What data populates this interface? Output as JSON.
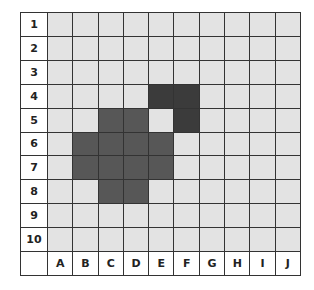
{
  "grid": {
    "row_labels": [
      "1",
      "2",
      "3",
      "4",
      "5",
      "6",
      "7",
      "8",
      "9",
      "10"
    ],
    "col_labels": [
      "A",
      "B",
      "C",
      "D",
      "E",
      "F",
      "G",
      "H",
      "I",
      "J"
    ],
    "colors": {
      "empty": "#e3e3e3",
      "shape": "#575757",
      "shape_dark": "#3b3b3b",
      "line": "#333333"
    },
    "shaded_cells": [
      {
        "cell": "E4",
        "tone": "dark"
      },
      {
        "cell": "F4",
        "tone": "dark"
      },
      {
        "cell": "F5",
        "tone": "dark"
      },
      {
        "cell": "C5",
        "tone": "medium"
      },
      {
        "cell": "D5",
        "tone": "medium"
      },
      {
        "cell": "B6",
        "tone": "medium"
      },
      {
        "cell": "C6",
        "tone": "medium"
      },
      {
        "cell": "D6",
        "tone": "medium"
      },
      {
        "cell": "E6",
        "tone": "medium"
      },
      {
        "cell": "B7",
        "tone": "medium"
      },
      {
        "cell": "C7",
        "tone": "medium"
      },
      {
        "cell": "D7",
        "tone": "medium"
      },
      {
        "cell": "E7",
        "tone": "medium"
      },
      {
        "cell": "C8",
        "tone": "medium"
      },
      {
        "cell": "D8",
        "tone": "medium"
      }
    ]
  }
}
